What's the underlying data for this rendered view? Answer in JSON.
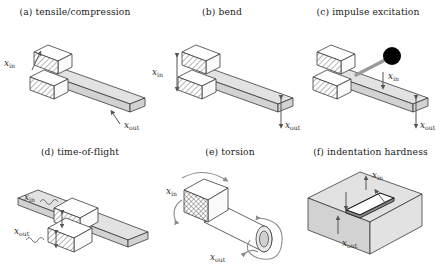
{
  "figure": {
    "caption_style": "lettered-subfigures",
    "background": "#ffffff",
    "ink": "#3a3a3a",
    "accent_gray": "#8c8c8c",
    "hammer_color": "#000000",
    "rod_color": "#9a9a9a"
  },
  "labels": {
    "x_in_base": "x",
    "x_in_sub": "in",
    "x_out_base": "x",
    "x_out_sub": "out"
  },
  "panels": [
    {
      "id": "a",
      "tag": "(a)",
      "title": "(a) tensile/compression",
      "name": "tensile-compression",
      "input_label": "x_in",
      "output_label": "x_out",
      "input_direction": "axial-along-beam",
      "output_direction": "axial-at-tip",
      "specimen": "cantilever-beam-with-clamp"
    },
    {
      "id": "b",
      "tag": "(b)",
      "title": "(b) bend",
      "name": "bend",
      "input_label": "x_in",
      "output_label": "x_out",
      "input_direction": "vertical-at-clamp",
      "output_direction": "vertical-at-tip",
      "specimen": "cantilever-beam-with-clamp"
    },
    {
      "id": "c",
      "tag": "(c)",
      "title": "(c) impulse excitation",
      "name": "impulse-excitation",
      "input_label": "x_in",
      "output_label": "x_out",
      "input_direction": "impact-hammer",
      "output_direction": "vertical-at-tip",
      "specimen": "cantilever-beam-with-clamp-and-hammer"
    },
    {
      "id": "d",
      "tag": "(d)",
      "title": "(d) time-of-flight",
      "name": "time-of-flight",
      "input_label": "x_in",
      "output_label": "x_out",
      "input_direction": "wave-pulse-in",
      "output_direction": "wave-pulse-out",
      "specimen": "through-beam-with-center-clamp"
    },
    {
      "id": "e",
      "tag": "(e)",
      "title": "(e) torsion",
      "name": "torsion",
      "input_label": "x_in",
      "output_label": "x_out",
      "input_direction": "rotation-at-fixed-end",
      "output_direction": "rotation-at-free-end",
      "specimen": "cylindrical-rod-with-hatched-block"
    },
    {
      "id": "f",
      "tag": "(f)",
      "title": "(f) indentation hardness",
      "name": "indentation-hardness",
      "input_label": "x_in",
      "output_label": "x_out",
      "input_direction": "indenter-down",
      "output_direction": "indent-depth",
      "specimen": "solid-block-with-indent"
    }
  ]
}
